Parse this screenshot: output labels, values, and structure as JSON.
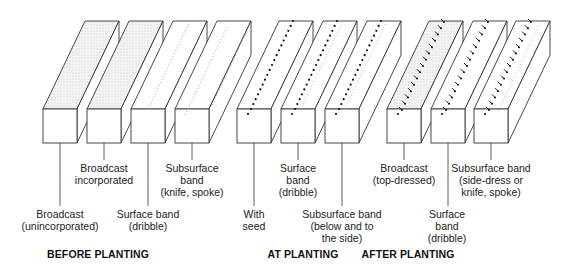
{
  "sections": [
    {
      "title": "BEFORE PLANTING",
      "x": 98,
      "y": 257
    },
    {
      "title": "AT PLANTING",
      "x": 303,
      "y": 257
    },
    {
      "title": "AFTER PLANTING",
      "x": 408,
      "y": 257
    }
  ],
  "geometry": {
    "front_w": 34,
    "front_h": 34,
    "depth_dx": 42,
    "depth_dy": -88,
    "front_top": 109
  },
  "boxes": [
    {
      "id": 1,
      "x": 43,
      "fill": "stipple",
      "pattern": "none",
      "leader_bottom": 206
    },
    {
      "id": 2,
      "x": 87,
      "fill": "stipple",
      "pattern": "none",
      "leader_bottom": 160
    },
    {
      "id": 3,
      "x": 131,
      "fill": "none",
      "pattern": "surface-dotted-line",
      "leader_bottom": 206
    },
    {
      "id": 4,
      "x": 175,
      "fill": "none",
      "pattern": "subsurface-dotted-line",
      "leader_bottom": 160
    },
    {
      "id": 5,
      "x": 237,
      "fill": "none",
      "pattern": "seed-dots",
      "leader_bottom": 206
    },
    {
      "id": 6,
      "x": 281,
      "fill": "none",
      "pattern": "seed-dots-surface-band",
      "leader_bottom": 160
    },
    {
      "id": 7,
      "x": 325,
      "fill": "none",
      "pattern": "seed-dots-subsurface-band",
      "leader_bottom": 206
    },
    {
      "id": 8,
      "x": 387,
      "fill": "stipple",
      "pattern": "plants-arrows",
      "leader_bottom": 160
    },
    {
      "id": 9,
      "x": 431,
      "fill": "none",
      "pattern": "plants-arrows-surface",
      "leader_bottom": 206
    },
    {
      "id": 10,
      "x": 474,
      "fill": "none",
      "pattern": "plants-arrows-subsurface",
      "leader_bottom": 160
    }
  ],
  "labels": [
    {
      "box": 1,
      "text": "Broadcast\n(unincorporated)",
      "x": 60,
      "y": 208
    },
    {
      "box": 2,
      "text": "Broadcast\nincorporated",
      "x": 104,
      "y": 162
    },
    {
      "box": 3,
      "text": "Surface band\n(dribble)",
      "x": 148,
      "y": 208
    },
    {
      "box": 4,
      "text": "Subsurface\nband\n(knife, spoke)",
      "x": 192,
      "y": 162
    },
    {
      "box": 5,
      "text": "With\nseed",
      "x": 254,
      "y": 208
    },
    {
      "box": 6,
      "text": "Surface\nband\n(dribble)",
      "x": 298,
      "y": 162
    },
    {
      "box": 7,
      "text": "Subsurface band\n(below and to\nthe side)",
      "x": 342,
      "y": 208
    },
    {
      "box": 8,
      "text": "Broadcast\n(top-dressed)",
      "x": 404,
      "y": 162
    },
    {
      "box": 9,
      "text": "Surface\nband\n(dribble)",
      "x": 447,
      "y": 208
    },
    {
      "box": 10,
      "text": "Subsurface band\n(side-dress or\nknife, spoke)",
      "x": 491,
      "y": 162
    }
  ],
  "colors": {
    "stroke": "#333333",
    "stipple": "#e6e6e6",
    "dots": "#111111",
    "band": "#999999"
  }
}
